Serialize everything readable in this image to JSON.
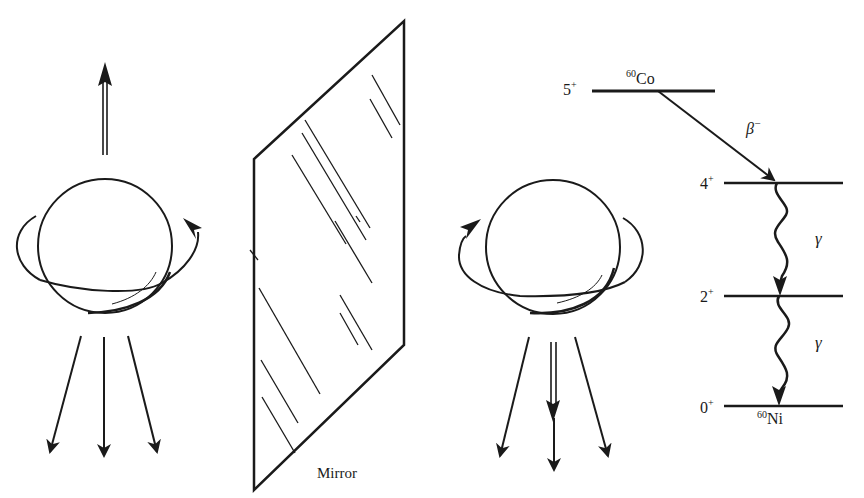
{
  "figure": {
    "mirror_label": "Mirror",
    "left_nucleus": {
      "spin_arrow": "up",
      "rotation": "counterclockwise-viewed-from-top",
      "electron_arrows": 3
    },
    "right_nucleus": {
      "spin_arrow": "down",
      "rotation": "clockwise-viewed-from-top",
      "electron_arrows": 3
    }
  },
  "decay_scheme": {
    "parent": {
      "mass": "60",
      "symbol": "Co",
      "spin": "5",
      "parity": "+"
    },
    "daughter": {
      "mass": "60",
      "symbol": "Ni"
    },
    "levels": [
      {
        "spin": "4",
        "parity": "+"
      },
      {
        "spin": "2",
        "parity": "+"
      },
      {
        "spin": "0",
        "parity": "+"
      }
    ],
    "transitions": [
      {
        "type": "beta",
        "label": "β",
        "sign": "−"
      },
      {
        "type": "gamma",
        "label": "γ"
      },
      {
        "type": "gamma",
        "label": "γ"
      }
    ]
  },
  "colors": {
    "ink": "#1a1a1a",
    "background": "#ffffff"
  }
}
